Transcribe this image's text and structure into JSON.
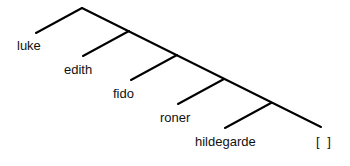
{
  "tree": {
    "type": "right-branching list tree",
    "leaves": [
      "luke",
      "edith",
      "fido",
      "roner",
      "hildegarde",
      "[ ]"
    ],
    "line_color": "#000000"
  }
}
